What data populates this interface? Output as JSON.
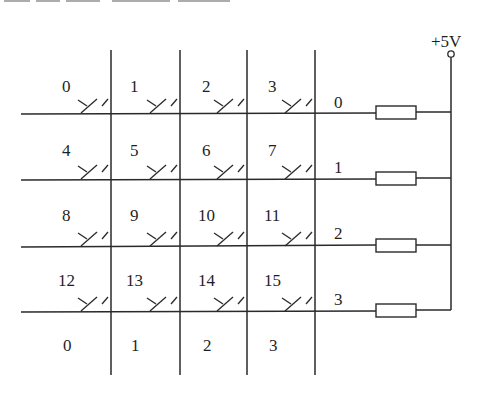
{
  "diagram": {
    "supply_label": "+5V",
    "keys": [
      [
        "0",
        "1",
        "2",
        "3"
      ],
      [
        "4",
        "5",
        "6",
        "7"
      ],
      [
        "8",
        "9",
        "10",
        "11"
      ],
      [
        "12",
        "13",
        "14",
        "15"
      ]
    ],
    "row_labels": [
      "0",
      "1",
      "2",
      "3"
    ],
    "column_labels": [
      "0",
      "1",
      "2",
      "3"
    ],
    "components": {
      "switches": 16,
      "pull_up_resistors": 4,
      "supply_terminal": 1
    },
    "colors": {
      "line": "#2a2a2a",
      "text": "#1f1f1f",
      "background": "#ffffff"
    }
  }
}
